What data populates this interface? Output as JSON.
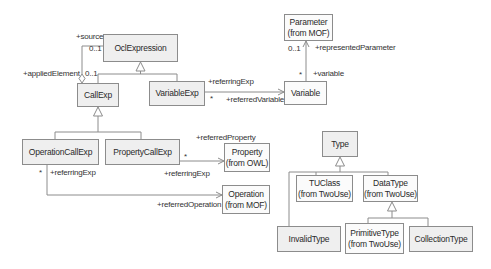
{
  "diagram": {
    "type": "uml-class-diagram",
    "classes": {
      "ocl_expression": {
        "name": "OclExpression"
      },
      "call_exp": {
        "name": "CallExp"
      },
      "variable_exp": {
        "name": "VariableExp"
      },
      "parameter": {
        "name": "Parameter",
        "stereotype": "(from MOF)"
      },
      "variable": {
        "name": "Variable"
      },
      "operation_call_exp": {
        "name": "OperationCallExp"
      },
      "property_call_exp": {
        "name": "PropertyCallExp"
      },
      "property": {
        "name": "Property",
        "stereotype": "(from OWL)"
      },
      "operation": {
        "name": "Operation",
        "stereotype": "(from MOF)"
      },
      "type": {
        "name": "Type"
      },
      "tu_class": {
        "name": "TUClass",
        "stereotype": "(from TwoUse)"
      },
      "data_type": {
        "name": "DataType",
        "stereotype": "(from TwoUse)"
      },
      "invalid_type": {
        "name": "InvalidType"
      },
      "primitive_type": {
        "name": "PrimitiveType",
        "stereotype": "(from TwoUse)"
      },
      "collection_type": {
        "name": "CollectionType"
      }
    },
    "labels": {
      "source_role": "+source",
      "source_mult": "0..1",
      "applied_role": "+appliedElement",
      "applied_mult": "0..1",
      "var_referring_role": "+referringExp",
      "var_referring_mult": "*",
      "referred_variable_role": "+referredVariable",
      "represented_param_role": "+representedParameter",
      "represented_param_mult": "0..1",
      "variable_role": "+variable",
      "variable_mult": "*",
      "referred_property_role": "+referredProperty",
      "prop_referring_mult": "*",
      "prop_referring_role": "+referringExp",
      "op_referring_mult": "*",
      "op_referring_role": "+referringExp",
      "referred_operation_role": "+referredOperation"
    }
  }
}
